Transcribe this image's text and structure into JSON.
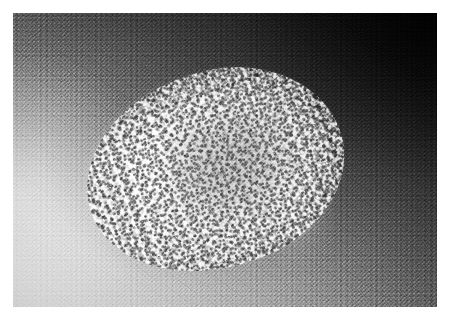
{
  "image": {
    "domain": "Natural-Image",
    "kind": "grayscale-photomicrograph",
    "subject": "verrucous granular lesion on textured skin surface",
    "caption": "",
    "canvas": {
      "width": 449,
      "height": 321
    },
    "margin": {
      "color": "#ffffff",
      "top": 13,
      "left": 13,
      "right": 12,
      "bottom": 14
    },
    "plate": {
      "x": 13,
      "y": 13,
      "width": 424,
      "height": 294
    },
    "palette": {
      "margin_white": "#ffffff",
      "background_light": "#d6d6d6",
      "background_mid": "#949494",
      "background_dark": "#242424",
      "background_darkest": "#151515",
      "lesion_bright": "#e8e8e8",
      "lesion_highlight": "#ffffff",
      "lesion_core_shadow": "#4a4a4a",
      "speckle_dark": "#191919"
    },
    "lighting": {
      "gradient_direction": "lower-left light to upper-right dark",
      "gradient_angle_deg": 34,
      "brightest_corner": "bottom-left",
      "darkest_corner": "top-right"
    },
    "lesion": {
      "shape": "irregular ellipse",
      "center_x": 215,
      "center_y": 170,
      "width": 262,
      "height": 196,
      "rotation_deg": -19,
      "texture": "granular cauliflower-like micronodules with bright speckles",
      "edge_left": "soft diffuse fade into light background",
      "edge_right": "ragged jagged boundary against dark background",
      "core": "slightly darker mottled depression right of center"
    },
    "texture": {
      "grain": "fine film grain",
      "fibre_direction_deg": -8,
      "noise_scale_px": 1
    }
  }
}
